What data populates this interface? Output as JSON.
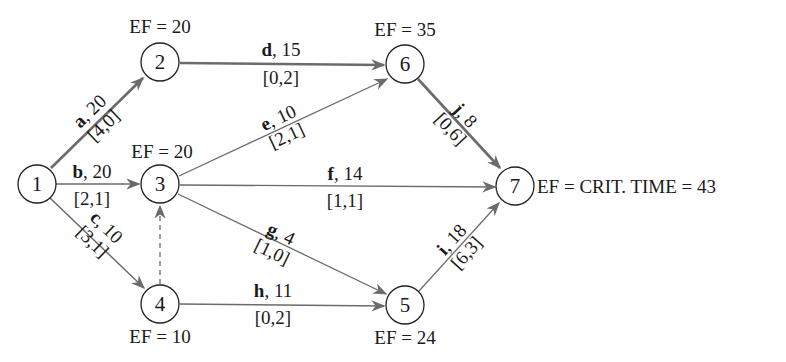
{
  "diagram": {
    "type": "activity-on-arrow network (CPM)",
    "critical_time_label": "EF = CRIT. TIME = 43",
    "colors": {
      "edge": "#6b6b6b",
      "node_stroke": "#222222",
      "text": "#1a1a1a"
    },
    "nodes": [
      {
        "id": "1",
        "ef": null
      },
      {
        "id": "2",
        "ef": "EF = 20"
      },
      {
        "id": "3",
        "ef": "EF = 20"
      },
      {
        "id": "4",
        "ef": "EF = 10"
      },
      {
        "id": "5",
        "ef": "EF = 24"
      },
      {
        "id": "6",
        "ef": "EF = 35"
      },
      {
        "id": "7",
        "ef": "EF = CRIT. TIME = 43"
      }
    ],
    "edges": [
      {
        "name": "a",
        "from": "1",
        "to": "2",
        "duration": ", 20",
        "bracket": "[4,0]",
        "critical": true
      },
      {
        "name": "b",
        "from": "1",
        "to": "3",
        "duration": ", 20",
        "bracket": "[2,1]",
        "critical": false
      },
      {
        "name": "c",
        "from": "1",
        "to": "4",
        "duration": ", 10",
        "bracket": "[3,1]",
        "critical": false
      },
      {
        "name": "d",
        "from": "2",
        "to": "6",
        "duration": ", 15",
        "bracket": "[0,2]",
        "critical": true
      },
      {
        "name": "e",
        "from": "3",
        "to": "6",
        "duration": ", 10",
        "bracket": "[2,1]",
        "critical": false
      },
      {
        "name": "f",
        "from": "3",
        "to": "7",
        "duration": ", 14",
        "bracket": "[1,1]",
        "critical": false
      },
      {
        "name": "g",
        "from": "3",
        "to": "5",
        "duration": ", 4",
        "bracket": "[1,0]",
        "critical": false
      },
      {
        "name": "h",
        "from": "4",
        "to": "5",
        "duration": ", 11",
        "bracket": "[0,2]",
        "critical": false
      },
      {
        "name": "i",
        "from": "5",
        "to": "7",
        "duration": ", 18",
        "bracket": "[6,3]",
        "critical": false
      },
      {
        "name": "j",
        "from": "6",
        "to": "7",
        "duration": ", 8",
        "bracket": "[0,6]",
        "critical": true
      },
      {
        "name": "dummy",
        "from": "4",
        "to": "3",
        "duration": "",
        "bracket": "",
        "critical": false,
        "dashed": true
      }
    ]
  }
}
